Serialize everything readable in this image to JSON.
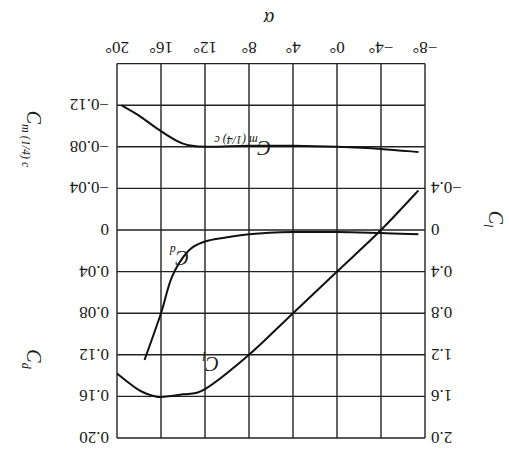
{
  "chart_data": {
    "type": "line",
    "title": "",
    "rotation_note": "figure is displayed upside down (rotated 180 degrees)",
    "xlabel": "α",
    "x_ticks": [
      "−8°",
      "−4°",
      "0°",
      "4°",
      "8°",
      "12°",
      "16°",
      "20°"
    ],
    "xlim": [
      -8,
      20
    ],
    "axes": {
      "left_cl": {
        "label": "C_l",
        "label_main": "C",
        "label_sub": "l",
        "ticks": [
          "−0.4",
          "0",
          "0.4",
          "0.8",
          "1.2",
          "1.6",
          "2.0"
        ],
        "ylim": [
          -0.4,
          2.0
        ]
      },
      "right_cd": {
        "label": "C_d",
        "label_main": "C",
        "label_sub": "d",
        "ticks": [
          "0",
          "0.04",
          "0.08",
          "0.12",
          "0.16",
          "0.20"
        ],
        "ylim": [
          0,
          0.2
        ]
      },
      "right_cm": {
        "label": "C_m(1/4)c",
        "label_main": "C",
        "label_sub": "m (1/4) c",
        "ticks": [
          "0",
          "−0.04",
          "−0.08",
          "−0.12"
        ],
        "ylim": [
          -0.12,
          0
        ]
      }
    },
    "grid": true,
    "series": [
      {
        "name": "C_l",
        "label_main": "C",
        "label_sub": "l",
        "axis": "left_cl",
        "x": [
          -7.4,
          -4,
          0,
          4,
          8,
          12,
          14,
          15.5,
          16.5,
          18,
          20
        ],
        "y": [
          -0.38,
          0.0,
          0.4,
          0.8,
          1.2,
          1.53,
          1.58,
          1.6,
          1.6,
          1.54,
          1.38
        ]
      },
      {
        "name": "C_d",
        "label_main": "C",
        "label_sub": "d",
        "axis": "right_cd",
        "x": [
          -7.4,
          -4,
          0,
          4,
          8,
          10,
          12,
          13.5,
          15,
          16,
          17.5
        ],
        "y": [
          0.004,
          0.003,
          0.002,
          0.002,
          0.004,
          0.007,
          0.011,
          0.02,
          0.045,
          0.08,
          0.125
        ]
      },
      {
        "name": "C_m(1/4)c",
        "label_main": "C",
        "label_sub": "m (1/4) c",
        "axis": "right_cm",
        "x": [
          -7.4,
          -4,
          0,
          4,
          8,
          12,
          14,
          16,
          18,
          19.6
        ],
        "y": [
          -0.075,
          -0.078,
          -0.08,
          -0.081,
          -0.081,
          -0.08,
          -0.083,
          -0.095,
          -0.11,
          -0.12
        ]
      }
    ]
  }
}
